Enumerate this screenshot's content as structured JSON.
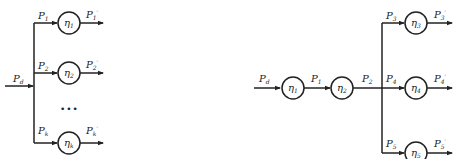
{
  "left_diagram": {
    "input": {
      "base": "P",
      "sub": "d"
    },
    "branches": [
      {
        "in": {
          "base": "P",
          "sub": "1"
        },
        "node": {
          "base": "η",
          "sub": "1"
        },
        "out": {
          "base": "P",
          "sub": "1",
          "prime": "′"
        }
      },
      {
        "in": {
          "base": "P",
          "sub": "2"
        },
        "node": {
          "base": "η",
          "sub": "2"
        },
        "out": {
          "base": "P",
          "sub": "2",
          "prime": "′"
        }
      },
      {
        "in": {
          "base": "P",
          "sub": "k"
        },
        "node": {
          "base": "η",
          "sub": "k"
        },
        "out": {
          "base": "P",
          "sub": "k",
          "prime": "′"
        }
      }
    ],
    "ellipsis": "•••"
  },
  "right_diagram": {
    "input": {
      "base": "P",
      "sub": "d"
    },
    "series": [
      {
        "node": {
          "base": "η",
          "sub": "1"
        },
        "out": {
          "base": "P",
          "sub": "1"
        }
      },
      {
        "node": {
          "base": "η",
          "sub": "2"
        },
        "out": {
          "base": "P",
          "sub": "2"
        }
      }
    ],
    "branches": [
      {
        "in": {
          "base": "P",
          "sub": "3"
        },
        "node": {
          "base": "η",
          "sub": "3"
        },
        "out": {
          "base": "P",
          "sub": "3",
          "prime": "′"
        }
      },
      {
        "in": {
          "base": "P",
          "sub": "4"
        },
        "node": {
          "base": "η",
          "sub": "4"
        },
        "out": {
          "base": "P",
          "sub": "4",
          "prime": "′"
        }
      },
      {
        "in": {
          "base": "P",
          "sub": "5"
        },
        "node": {
          "base": "η",
          "sub": "5"
        },
        "out": {
          "base": "P",
          "sub": "5",
          "prime": "′"
        }
      }
    ]
  }
}
